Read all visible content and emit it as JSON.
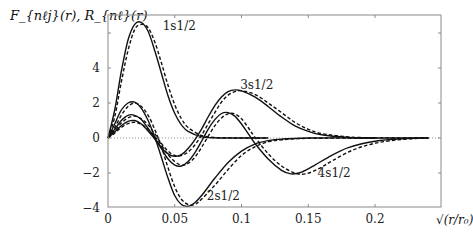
{
  "chart_data": {
    "type": "line",
    "title": "",
    "ylabel": "F_{nℓj}(r), R_{nℓ}(r)",
    "xlabel": "√(r/r₀)",
    "xlim": [
      0,
      0.25
    ],
    "ylim": [
      -4,
      7
    ],
    "x_ticks": [
      {
        "value": 0,
        "label": "0"
      },
      {
        "value": 0.05,
        "label": "0.05"
      },
      {
        "value": 0.1,
        "label": "0.1"
      },
      {
        "value": 0.15,
        "label": "0.15"
      },
      {
        "value": 0.2,
        "label": "0.2"
      }
    ],
    "y_ticks": [
      {
        "value": -4,
        "label": "−4"
      },
      {
        "value": -2,
        "label": "−2"
      },
      {
        "value": 0,
        "label": "0"
      },
      {
        "value": 2,
        "label": "2"
      },
      {
        "value": 4,
        "label": "4"
      },
      {
        "value": 6,
        "label": ""
      }
    ],
    "grid": false,
    "zero_line": {
      "style": "dotted",
      "color": "#9a9a9a"
    },
    "annotations": [
      {
        "text": "1s1/2",
        "x": 0.041,
        "y": 6.2
      },
      {
        "text": "3s1/2",
        "x": 0.099,
        "y": 2.8
      },
      {
        "text": "2s1/2",
        "x": 0.074,
        "y": -3.55
      },
      {
        "text": "4s1/2",
        "x": 0.157,
        "y": -2.25
      }
    ],
    "series": [
      {
        "name": "1s1/2 F (solid)",
        "style": "solid",
        "x": [
          0,
          0.005,
          0.01,
          0.015,
          0.02,
          0.025,
          0.03,
          0.035,
          0.04,
          0.045,
          0.05,
          0.055,
          0.06,
          0.07,
          0.08,
          0.09,
          0.1,
          0.12
        ],
        "y": [
          0,
          1.6,
          3.8,
          5.6,
          6.5,
          6.6,
          6.1,
          5.0,
          3.7,
          2.4,
          1.4,
          0.75,
          0.38,
          0.08,
          0.01,
          0,
          0,
          0
        ]
      },
      {
        "name": "1s1/2 R (dashed)",
        "style": "dashed",
        "x": [
          0,
          0.005,
          0.01,
          0.015,
          0.02,
          0.025,
          0.03,
          0.035,
          0.04,
          0.045,
          0.05,
          0.055,
          0.06,
          0.07,
          0.08,
          0.09,
          0.1,
          0.12
        ],
        "y": [
          0,
          1.2,
          3.2,
          5.0,
          6.2,
          6.5,
          6.3,
          5.5,
          4.3,
          3.0,
          1.9,
          1.1,
          0.6,
          0.15,
          0.03,
          0.01,
          0,
          0
        ]
      },
      {
        "name": "2s1/2 F (solid)",
        "style": "solid",
        "x": [
          0,
          0.005,
          0.01,
          0.015,
          0.02,
          0.025,
          0.03,
          0.035,
          0.04,
          0.045,
          0.05,
          0.055,
          0.06,
          0.065,
          0.07,
          0.08,
          0.09,
          0.1,
          0.11,
          0.12,
          0.13,
          0.15,
          0.2
        ],
        "y": [
          0,
          0.8,
          1.6,
          2.0,
          2.05,
          1.7,
          1.0,
          0.05,
          -1.1,
          -2.3,
          -3.3,
          -3.8,
          -3.9,
          -3.7,
          -3.3,
          -2.3,
          -1.4,
          -0.75,
          -0.35,
          -0.15,
          -0.06,
          0,
          0
        ]
      },
      {
        "name": "2s1/2 R (dashed)",
        "style": "dashed",
        "x": [
          0,
          0.005,
          0.01,
          0.015,
          0.02,
          0.025,
          0.03,
          0.035,
          0.04,
          0.045,
          0.05,
          0.055,
          0.06,
          0.065,
          0.07,
          0.08,
          0.09,
          0.1,
          0.11,
          0.12,
          0.13,
          0.15,
          0.2
        ],
        "y": [
          0,
          0.6,
          1.3,
          1.8,
          2.0,
          1.8,
          1.3,
          0.5,
          -0.5,
          -1.7,
          -2.8,
          -3.5,
          -3.8,
          -3.8,
          -3.5,
          -2.7,
          -1.8,
          -1.0,
          -0.5,
          -0.22,
          -0.1,
          -0.02,
          0
        ]
      },
      {
        "name": "3s1/2 F (solid)",
        "style": "solid",
        "x": [
          0,
          0.005,
          0.01,
          0.015,
          0.02,
          0.025,
          0.03,
          0.035,
          0.04,
          0.045,
          0.05,
          0.055,
          0.06,
          0.065,
          0.07,
          0.075,
          0.08,
          0.085,
          0.09,
          0.095,
          0.1,
          0.11,
          0.12,
          0.13,
          0.14,
          0.15,
          0.16,
          0.18,
          0.2,
          0.24
        ],
        "y": [
          0,
          0.5,
          1.0,
          1.3,
          1.3,
          1.05,
          0.55,
          0.0,
          -0.55,
          -0.9,
          -1.05,
          -0.95,
          -0.6,
          -0.1,
          0.5,
          1.2,
          1.85,
          2.35,
          2.65,
          2.75,
          2.7,
          2.35,
          1.8,
          1.2,
          0.7,
          0.38,
          0.18,
          0.03,
          0,
          0
        ]
      },
      {
        "name": "3s1/2 R (dashed)",
        "style": "dashed",
        "x": [
          0,
          0.005,
          0.01,
          0.015,
          0.02,
          0.025,
          0.03,
          0.035,
          0.04,
          0.045,
          0.05,
          0.055,
          0.06,
          0.065,
          0.07,
          0.075,
          0.08,
          0.085,
          0.09,
          0.095,
          0.1,
          0.11,
          0.12,
          0.13,
          0.14,
          0.15,
          0.16,
          0.18,
          0.2,
          0.24
        ],
        "y": [
          0,
          0.4,
          0.85,
          1.15,
          1.25,
          1.1,
          0.75,
          0.25,
          -0.3,
          -0.75,
          -1.0,
          -1.0,
          -0.8,
          -0.4,
          0.15,
          0.8,
          1.45,
          2.05,
          2.45,
          2.65,
          2.7,
          2.5,
          2.0,
          1.45,
          0.9,
          0.5,
          0.25,
          0.06,
          0.01,
          0
        ]
      },
      {
        "name": "4s1/2 F (solid)",
        "style": "solid",
        "x": [
          0,
          0.005,
          0.01,
          0.015,
          0.02,
          0.025,
          0.03,
          0.035,
          0.04,
          0.045,
          0.05,
          0.055,
          0.06,
          0.065,
          0.07,
          0.075,
          0.08,
          0.085,
          0.09,
          0.095,
          0.1,
          0.105,
          0.11,
          0.12,
          0.13,
          0.137,
          0.145,
          0.155,
          0.165,
          0.18,
          0.2,
          0.22,
          0.24
        ],
        "y": [
          0,
          0.35,
          0.7,
          0.95,
          1.0,
          0.8,
          0.4,
          -0.05,
          -0.6,
          -1.2,
          -1.55,
          -1.6,
          -1.35,
          -0.85,
          -0.2,
          0.5,
          1.05,
          1.4,
          1.45,
          1.25,
          0.8,
          0.25,
          -0.3,
          -1.2,
          -1.85,
          -2.05,
          -1.95,
          -1.55,
          -1.1,
          -0.55,
          -0.18,
          -0.04,
          0
        ]
      },
      {
        "name": "4s1/2 R (dashed)",
        "style": "dashed",
        "x": [
          0,
          0.005,
          0.01,
          0.015,
          0.02,
          0.025,
          0.03,
          0.035,
          0.04,
          0.045,
          0.05,
          0.055,
          0.06,
          0.065,
          0.07,
          0.075,
          0.08,
          0.085,
          0.09,
          0.095,
          0.1,
          0.105,
          0.11,
          0.12,
          0.13,
          0.14,
          0.148,
          0.158,
          0.168,
          0.183,
          0.2,
          0.22,
          0.24
        ],
        "y": [
          0,
          0.28,
          0.6,
          0.82,
          0.9,
          0.78,
          0.5,
          0.1,
          -0.4,
          -0.95,
          -1.35,
          -1.55,
          -1.45,
          -1.1,
          -0.55,
          0.1,
          0.7,
          1.15,
          1.38,
          1.38,
          1.1,
          0.6,
          0.05,
          -0.9,
          -1.6,
          -2.0,
          -2.05,
          -1.75,
          -1.3,
          -0.7,
          -0.3,
          -0.08,
          0
        ]
      }
    ]
  }
}
